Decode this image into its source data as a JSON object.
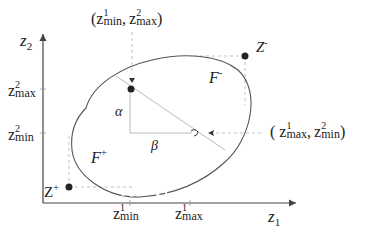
{
  "axes": {
    "x_label": "z",
    "x_label_sub": "1",
    "y_label": "z",
    "y_label_sub": "2"
  },
  "ticks": {
    "y_max": {
      "base": "z",
      "sup": "2",
      "sub": "max"
    },
    "y_min": {
      "base": "z",
      "sup": "2",
      "sub": "min"
    },
    "x_min": {
      "base": "z",
      "sup": "1",
      "sub": "min"
    },
    "x_max": {
      "base": "z",
      "sup": "1",
      "sub": "max"
    }
  },
  "points": {
    "z_plus": {
      "base": "Z",
      "sup": "+"
    },
    "z_minus": {
      "base": "Z",
      "sup": "-"
    }
  },
  "regions": {
    "f_plus": {
      "base": "F",
      "sup": "+"
    },
    "f_minus": {
      "base": "F",
      "sup": "-"
    }
  },
  "angles": {
    "alpha": "α",
    "beta": "β"
  },
  "annotations": {
    "top": {
      "open": "(",
      "a_base": "z",
      "a_sup": "1",
      "a_sub": "min",
      "sep": ",",
      "b_base": "z",
      "b_sup": "2",
      "b_sub": "max",
      "close": ")"
    },
    "right": {
      "open": "(",
      "a_base": "z",
      "a_sup": "1",
      "a_sub": "max",
      "sep": ",",
      "b_base": "z",
      "b_sup": "2",
      "b_sub": "min",
      "close": ")"
    }
  },
  "colors": {
    "line": "#555555",
    "dashed": "#bbbbbb",
    "point": "#222222"
  }
}
